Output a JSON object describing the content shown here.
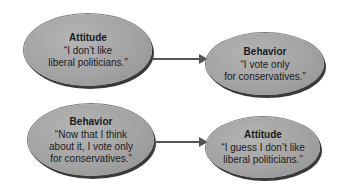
{
  "diagrams": [
    {
      "source": {
        "title": "Attitude",
        "quote": "“I don’t like liberal politicians.”",
        "lines": [
          "“I don’t like",
          "liberal politicians.”"
        ]
      },
      "target": {
        "title": "Behavior",
        "lines": [
          "“I vote only",
          "for conservatives.”"
        ]
      }
    },
    {
      "source": {
        "title": "Behavior",
        "lines": [
          "“Now that I think",
          "about it, I vote only",
          "for conservatives.”"
        ]
      },
      "target": {
        "title": "Attitude",
        "lines": [
          "“I guess I don’t like",
          "liberal politicians.”"
        ]
      }
    }
  ],
  "colors": {
    "ellipse_fill": "#a3a3a3",
    "arrow": "#555555",
    "outline": "#3a3a3a"
  }
}
